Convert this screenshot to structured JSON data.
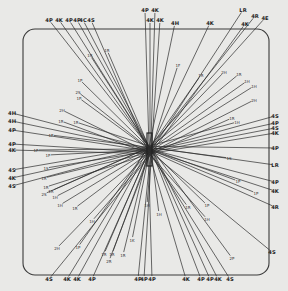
{
  "diagram": {
    "center": [
      150,
      150
    ],
    "frame": {
      "x": 23,
      "y": 29,
      "w": 246,
      "h": 246,
      "r": 12
    },
    "colors": {
      "background": "#e9e9e7",
      "ink": "#2b2b2b"
    },
    "outer_rays": [
      {
        "label": "4P",
        "x": 49,
        "y": 20
      },
      {
        "label": "4K",
        "x": 59,
        "y": 20
      },
      {
        "label": "4P",
        "x": 69,
        "y": 20
      },
      {
        "label": "4P",
        "x": 77,
        "y": 20
      },
      {
        "label": "4C",
        "x": 83,
        "y": 20
      },
      {
        "label": "4S",
        "x": 91,
        "y": 20
      },
      {
        "label": "4P",
        "x": 145,
        "y": 10
      },
      {
        "label": "4K",
        "x": 150,
        "y": 20
      },
      {
        "label": "4K",
        "x": 155,
        "y": 10
      },
      {
        "label": "4K",
        "x": 160,
        "y": 20
      },
      {
        "label": "4H",
        "x": 175,
        "y": 23
      },
      {
        "label": "4K",
        "x": 210,
        "y": 23
      },
      {
        "label": "LR",
        "x": 243,
        "y": 10
      },
      {
        "label": "4K",
        "x": 245,
        "y": 24
      },
      {
        "label": "4R",
        "x": 255,
        "y": 16
      },
      {
        "label": "4E",
        "x": 265,
        "y": 18
      },
      {
        "label": "4H",
        "x": 12,
        "y": 113
      },
      {
        "label": "4H",
        "x": 12,
        "y": 121
      },
      {
        "label": "4P",
        "x": 12,
        "y": 130
      },
      {
        "label": "4P",
        "x": 12,
        "y": 144
      },
      {
        "label": "4K",
        "x": 12,
        "y": 150
      },
      {
        "label": "4S",
        "x": 12,
        "y": 170
      },
      {
        "label": "4K",
        "x": 12,
        "y": 178
      },
      {
        "label": "4S",
        "x": 12,
        "y": 186
      },
      {
        "label": "4S",
        "x": 275,
        "y": 116
      },
      {
        "label": "4P",
        "x": 275,
        "y": 123
      },
      {
        "label": "4S",
        "x": 275,
        "y": 128
      },
      {
        "label": "4K",
        "x": 275,
        "y": 133
      },
      {
        "label": "4P",
        "x": 275,
        "y": 148
      },
      {
        "label": "LR",
        "x": 275,
        "y": 165
      },
      {
        "label": "4P",
        "x": 275,
        "y": 182
      },
      {
        "label": "4K",
        "x": 275,
        "y": 191
      },
      {
        "label": "4R",
        "x": 275,
        "y": 207
      },
      {
        "label": "4S",
        "x": 272,
        "y": 252
      },
      {
        "label": "4S",
        "x": 49,
        "y": 279
      },
      {
        "label": "4K",
        "x": 67,
        "y": 279
      },
      {
        "label": "4K",
        "x": 77,
        "y": 279
      },
      {
        "label": "4P",
        "x": 92,
        "y": 279
      },
      {
        "label": "4P",
        "x": 138,
        "y": 279
      },
      {
        "label": "4P",
        "x": 144,
        "y": 279
      },
      {
        "label": "4P",
        "x": 152,
        "y": 279
      },
      {
        "label": "4K",
        "x": 186,
        "y": 279
      },
      {
        "label": "4P",
        "x": 201,
        "y": 279
      },
      {
        "label": "4P",
        "x": 210,
        "y": 279
      },
      {
        "label": "4K",
        "x": 218,
        "y": 279
      },
      {
        "label": "4S",
        "x": 230,
        "y": 279
      }
    ],
    "inner_rays": [
      {
        "label": "1R",
        "x": 90,
        "y": 55
      },
      {
        "label": "1R",
        "x": 107,
        "y": 50
      },
      {
        "label": "1P",
        "x": 80,
        "y": 80
      },
      {
        "label": "2S",
        "x": 78,
        "y": 92
      },
      {
        "label": "1P",
        "x": 79,
        "y": 98
      },
      {
        "label": "2H",
        "x": 62,
        "y": 110
      },
      {
        "label": "1R",
        "x": 61,
        "y": 121
      },
      {
        "label": "1R",
        "x": 76,
        "y": 122
      },
      {
        "label": "1P",
        "x": 51,
        "y": 135
      },
      {
        "label": "1P",
        "x": 36,
        "y": 150
      },
      {
        "label": "1P",
        "x": 48,
        "y": 155
      },
      {
        "label": "1S",
        "x": 46,
        "y": 168
      },
      {
        "label": "1R",
        "x": 44,
        "y": 178
      },
      {
        "label": "1R",
        "x": 46,
        "y": 187
      },
      {
        "label": "1R",
        "x": 51,
        "y": 191
      },
      {
        "label": "2S",
        "x": 44,
        "y": 194
      },
      {
        "label": "1H",
        "x": 55,
        "y": 197
      },
      {
        "label": "1H",
        "x": 60,
        "y": 205
      },
      {
        "label": "1R",
        "x": 75,
        "y": 208
      },
      {
        "label": "1H",
        "x": 92,
        "y": 221
      },
      {
        "label": "2H",
        "x": 57,
        "y": 248
      },
      {
        "label": "1P",
        "x": 78,
        "y": 247
      },
      {
        "label": "1R",
        "x": 104,
        "y": 254
      },
      {
        "label": "1R",
        "x": 112,
        "y": 254
      },
      {
        "label": "2R",
        "x": 109,
        "y": 261
      },
      {
        "label": "1R",
        "x": 123,
        "y": 255
      },
      {
        "label": "1K",
        "x": 132,
        "y": 240
      },
      {
        "label": "1F",
        "x": 178,
        "y": 65
      },
      {
        "label": "1R",
        "x": 201,
        "y": 75
      },
      {
        "label": "2H",
        "x": 224,
        "y": 72
      },
      {
        "label": "1R",
        "x": 239,
        "y": 74
      },
      {
        "label": "1H",
        "x": 247,
        "y": 81
      },
      {
        "label": "1H",
        "x": 254,
        "y": 86
      },
      {
        "label": "2H",
        "x": 254,
        "y": 100
      },
      {
        "label": "1R",
        "x": 232,
        "y": 118
      },
      {
        "label": "1H",
        "x": 237,
        "y": 122
      },
      {
        "label": "1S",
        "x": 229,
        "y": 158
      },
      {
        "label": "1P",
        "x": 238,
        "y": 181
      },
      {
        "label": "1P",
        "x": 256,
        "y": 193
      },
      {
        "label": "1P",
        "x": 207,
        "y": 205
      },
      {
        "label": "1R",
        "x": 188,
        "y": 207
      },
      {
        "label": "1H",
        "x": 207,
        "y": 219
      },
      {
        "label": "2P",
        "x": 232,
        "y": 258
      },
      {
        "label": "1H",
        "x": 159,
        "y": 214
      },
      {
        "label": "1H",
        "x": 147,
        "y": 205
      }
    ]
  }
}
